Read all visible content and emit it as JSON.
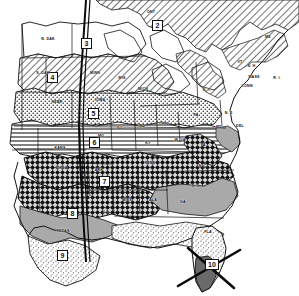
{
  "map": {
    "title": "Plant Hardiness Zone Map of the Eastern United States",
    "type": "choropleth-zone-map",
    "width": 299,
    "height": 296,
    "background_color": "#ffffff",
    "ink_color": "#111111",
    "zone_boxes": [
      {
        "id": "zone-2",
        "label": "2",
        "x": 157,
        "y": 25
      },
      {
        "id": "zone-3",
        "label": "3",
        "x": 86,
        "y": 43
      },
      {
        "id": "zone-4",
        "label": "4",
        "x": 52,
        "y": 77
      },
      {
        "id": "zone-5",
        "label": "5",
        "x": 93,
        "y": 113
      },
      {
        "id": "zone-6",
        "label": "6",
        "x": 94,
        "y": 142
      },
      {
        "id": "zone-7",
        "label": "7",
        "x": 104,
        "y": 181
      },
      {
        "id": "zone-8",
        "label": "8",
        "x": 72,
        "y": 213
      },
      {
        "id": "zone-9",
        "label": "9",
        "x": 62,
        "y": 255
      },
      {
        "id": "zone-10",
        "label": "10",
        "x": 212,
        "y": 264
      }
    ],
    "region_labels": [
      {
        "id": "ont",
        "label": "ONT",
        "x": 151,
        "y": 12,
        "size": "sm"
      },
      {
        "id": "n-dak",
        "label": "N. DAK",
        "x": 48,
        "y": 39,
        "size": "sm"
      },
      {
        "id": "s-dak",
        "label": "S. DAK",
        "x": 43,
        "y": 73,
        "size": "sm"
      },
      {
        "id": "minn",
        "label": "MINN",
        "x": 95,
        "y": 73,
        "size": "sm"
      },
      {
        "id": "wis",
        "label": "WIS",
        "x": 122,
        "y": 78,
        "size": "sm"
      },
      {
        "id": "nebr",
        "label": "NEBR",
        "x": 57,
        "y": 102,
        "size": "sm"
      },
      {
        "id": "iowa",
        "label": "IOWA",
        "x": 100,
        "y": 100,
        "size": "sm"
      },
      {
        "id": "mich",
        "label": "MICH",
        "x": 143,
        "y": 89,
        "size": "sm"
      },
      {
        "id": "kans",
        "label": "KANS",
        "x": 60,
        "y": 148,
        "size": "sm"
      },
      {
        "id": "mo",
        "label": "MO",
        "x": 101,
        "y": 136,
        "size": "sm"
      },
      {
        "id": "ill",
        "label": "ILL",
        "x": 120,
        "y": 128,
        "size": "sm"
      },
      {
        "id": "ind",
        "label": "IND",
        "x": 142,
        "y": 126,
        "size": "sm"
      },
      {
        "id": "ohio",
        "label": "OHIO",
        "x": 164,
        "y": 124,
        "size": "sm"
      },
      {
        "id": "ky",
        "label": "KY",
        "x": 148,
        "y": 143,
        "size": "sm"
      },
      {
        "id": "w-va",
        "label": "W. VA",
        "x": 180,
        "y": 140,
        "size": "sm"
      },
      {
        "id": "va",
        "label": "VA",
        "x": 203,
        "y": 145,
        "size": "sm"
      },
      {
        "id": "pa",
        "label": "PA",
        "x": 196,
        "y": 115,
        "size": "sm"
      },
      {
        "id": "ny",
        "label": "N. Y.",
        "x": 207,
        "y": 90,
        "size": "sm"
      },
      {
        "id": "me",
        "label": "ME",
        "x": 268,
        "y": 37,
        "size": "sm"
      },
      {
        "id": "vt",
        "label": "VT",
        "x": 240,
        "y": 62,
        "size": "sm"
      },
      {
        "id": "nh",
        "label": "N. H.",
        "x": 250,
        "y": 66,
        "size": "sm"
      },
      {
        "id": "mass",
        "label": "MASS",
        "x": 252,
        "y": 77,
        "size": "sm"
      },
      {
        "id": "conn",
        "label": "CONN",
        "x": 247,
        "y": 85,
        "size": "sm"
      },
      {
        "id": "ri",
        "label": "R. I.",
        "x": 276,
        "y": 78,
        "size": "sm"
      },
      {
        "id": "nj",
        "label": "N. J.",
        "x": 229,
        "y": 113,
        "size": "sm"
      },
      {
        "id": "del",
        "label": "DEL",
        "x": 238,
        "y": 126,
        "size": "sm"
      },
      {
        "id": "md",
        "label": "MD",
        "x": 219,
        "y": 126,
        "size": "sm"
      },
      {
        "id": "okla",
        "label": "OKLA",
        "x": 62,
        "y": 168,
        "size": "sm"
      },
      {
        "id": "ark",
        "label": "ARK",
        "x": 99,
        "y": 170,
        "size": "sm"
      },
      {
        "id": "tenn",
        "label": "TENN",
        "x": 150,
        "y": 163,
        "size": "sm"
      },
      {
        "id": "nc",
        "label": "N. C.",
        "x": 203,
        "y": 166,
        "size": "sm"
      },
      {
        "id": "sc",
        "label": "S. C.",
        "x": 196,
        "y": 186,
        "size": "sm"
      },
      {
        "id": "miss",
        "label": "MISS",
        "x": 127,
        "y": 200,
        "size": "sm"
      },
      {
        "id": "ala",
        "label": "ALA",
        "x": 153,
        "y": 200,
        "size": "sm"
      },
      {
        "id": "ga",
        "label": "GA",
        "x": 183,
        "y": 202,
        "size": "sm"
      },
      {
        "id": "la",
        "label": "LA",
        "x": 106,
        "y": 212,
        "size": "sm"
      },
      {
        "id": "texas",
        "label": "TEXAS",
        "x": 63,
        "y": 231,
        "size": "sm"
      },
      {
        "id": "fla",
        "label": "FLA",
        "x": 208,
        "y": 232,
        "size": "sm"
      }
    ],
    "marker": {
      "id": "florida-cross-marker",
      "description": "cross mark over southern Florida",
      "x": 208,
      "y": 265
    }
  }
}
